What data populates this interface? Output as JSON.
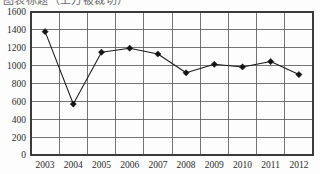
{
  "title_sliver": {
    "text": "图表标题（上方被裁切）"
  },
  "chart_data": {
    "type": "line",
    "title": "",
    "subtitle": "",
    "xlabel": "",
    "ylabel": "",
    "categories": [
      "2003",
      "2004",
      "2005",
      "2006",
      "2007",
      "2008",
      "2009",
      "2010",
      "2011",
      "2012"
    ],
    "values": [
      1380,
      570,
      1150,
      1195,
      1130,
      920,
      1015,
      985,
      1045,
      900
    ],
    "series": [
      {
        "name": "series-1",
        "values": [
          1380,
          570,
          1150,
          1195,
          1130,
          920,
          1015,
          985,
          1045,
          900
        ]
      }
    ],
    "ylim": [
      0,
      1600
    ],
    "ytick_step": 200,
    "yticks": [
      0,
      200,
      400,
      600,
      800,
      1000,
      1200,
      1400,
      1600
    ],
    "ytick_labels": [
      "0",
      "200",
      "400",
      "600",
      "800",
      "1000",
      "1200",
      "1400",
      "1600"
    ],
    "xtick_labels": [
      "2003",
      "2004",
      "2005",
      "2006",
      "2007",
      "2008",
      "2009",
      "2010",
      "2011",
      "2012"
    ],
    "grid": true,
    "grid_horizontal": true,
    "grid_vertical": true,
    "legend": false,
    "legend_position": "none",
    "marker": "diamond",
    "line_color": "#1c1c1c",
    "marker_color": "#141414",
    "grid_color": "#5c5c5c",
    "background_color": "#fdfdfd",
    "annotations": []
  }
}
